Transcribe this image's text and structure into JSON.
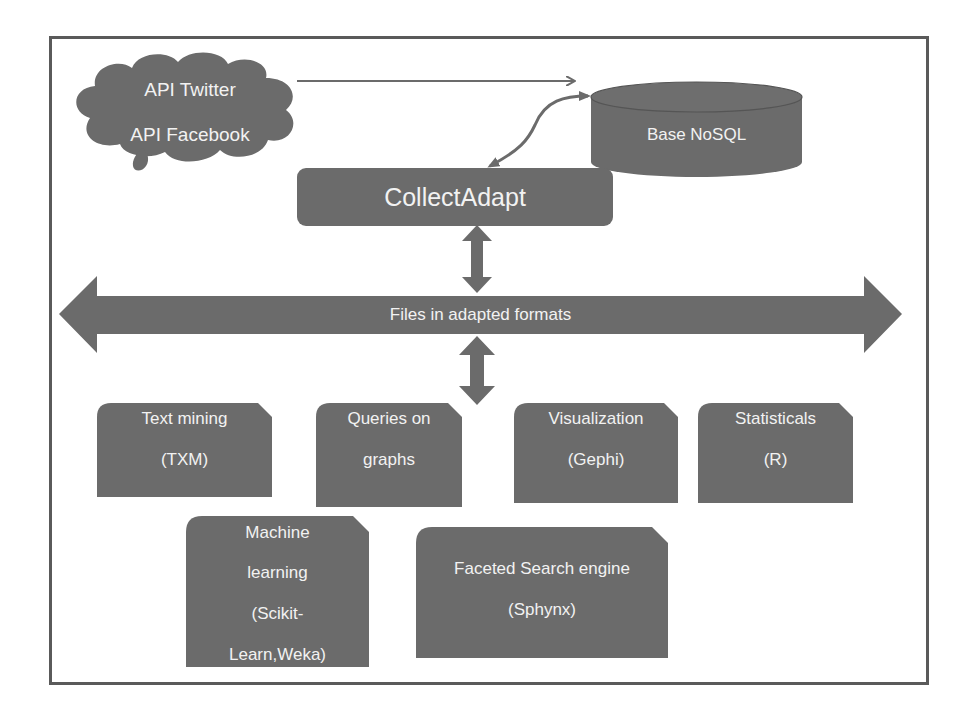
{
  "colors": {
    "shape_fill": "#6b6b6b",
    "text": "#f2f2f2",
    "frame": "#5a5a5a",
    "background": "#ffffff"
  },
  "source": {
    "line1": "API Twitter",
    "line2": "API Facebook",
    "shape": "cloud-icon"
  },
  "database": {
    "label": "Base NoSQL",
    "shape": "database-cylinder-icon"
  },
  "collector": {
    "label": "CollectAdapt"
  },
  "bus": {
    "label": "Files in adapted formats"
  },
  "tools": [
    {
      "line1": "Text mining",
      "line2": "(TXM)"
    },
    {
      "line1": "Queries on",
      "line2": "graphs"
    },
    {
      "line1": "Visualization",
      "line2": "(Gephi)"
    },
    {
      "line1": "Statisticals",
      "line2": "(R)"
    },
    {
      "line1": "Machine",
      "line2": "learning",
      "line3": "(Scikit-",
      "line4": "Learn,Weka)"
    },
    {
      "line1": "Faceted Search engine",
      "line2": "(Sphynx)"
    }
  ],
  "connections": [
    {
      "from": "source",
      "to": "database",
      "type": "arrow"
    },
    {
      "from": "collector",
      "to": "database",
      "type": "curved-double-arrow"
    },
    {
      "from": "collector",
      "to": "bus",
      "type": "double-arrow"
    },
    {
      "from": "bus",
      "to": "tools",
      "type": "double-arrow"
    }
  ]
}
